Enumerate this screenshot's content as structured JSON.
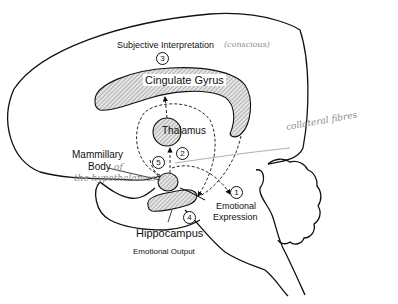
{
  "diagram": {
    "type": "Papez circuit (limbic system) sagittal brain diagram",
    "structures": {
      "cingulate_gyrus": "Cingulate Gyrus",
      "thalamus": "Thalamus",
      "mammillary_body_line1": "Mammillary",
      "mammillary_body_line2": "Body",
      "hippocampus": "Hippocampus"
    },
    "labels": {
      "subjective_interpretation": "Subjective Interpretation",
      "emotional_expression_line1": "Emotional",
      "emotional_expression_line2": "Expression",
      "emotional_output": "Emotional Output"
    },
    "step_numbers": {
      "step1": "1",
      "step2": "2",
      "step3": "3",
      "step4": "4",
      "step5": "5"
    },
    "handwritten_annotations": {
      "conscious": "(conscious)",
      "of": "of",
      "the_hypothalamus": "the hypothalamus",
      "collateral_fibres": "collateral fibres"
    },
    "colors": {
      "ink": "#111111",
      "hatch_fill": "#c8c8c8",
      "handwriting": "#8a8a8a",
      "background": "#ffffff"
    }
  }
}
